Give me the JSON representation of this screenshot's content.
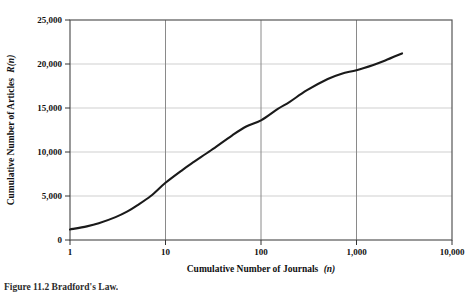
{
  "figure": {
    "caption": "Figure 11.2   Bradford's Law."
  },
  "chart_data": {
    "type": "line",
    "title": "",
    "xlabel": "Cumulative Number of Journals (n)",
    "xlabel_main": "Cumulative Number of Journals",
    "xlabel_italic": "(n)",
    "ylabel": "Cumulative Number of Articles R(n)",
    "ylabel_main": "Cumulative Number of Articles",
    "ylabel_italic": "R(n)",
    "xscale": "log",
    "yscale": "linear",
    "xlim": [
      1,
      10000
    ],
    "ylim": [
      0,
      25000
    ],
    "grid": true,
    "legend": "none",
    "xticks": [
      1,
      10,
      100,
      1000,
      10000
    ],
    "xtick_labels": [
      "1",
      "10",
      "100",
      "1,000",
      "10,000"
    ],
    "yticks": [
      0,
      5000,
      10000,
      15000,
      20000,
      25000
    ],
    "ytick_labels": [
      "0",
      "5,000",
      "10,000",
      "15,000",
      "20,000",
      "25,000"
    ],
    "series": [
      {
        "name": "Cumulative articles",
        "color": "#1a1a1a",
        "x": [
          1,
          1.5,
          2,
          3,
          4,
          5,
          7,
          10,
          15,
          20,
          30,
          50,
          70,
          100,
          150,
          200,
          300,
          500,
          700,
          1000,
          1500,
          2000,
          3000
        ],
        "y": [
          1200,
          1550,
          1900,
          2600,
          3250,
          3900,
          5000,
          6500,
          7950,
          8900,
          10200,
          11900,
          12900,
          13600,
          14900,
          15700,
          17000,
          18300,
          18900,
          19300,
          19900,
          20400,
          21200
        ]
      }
    ]
  }
}
